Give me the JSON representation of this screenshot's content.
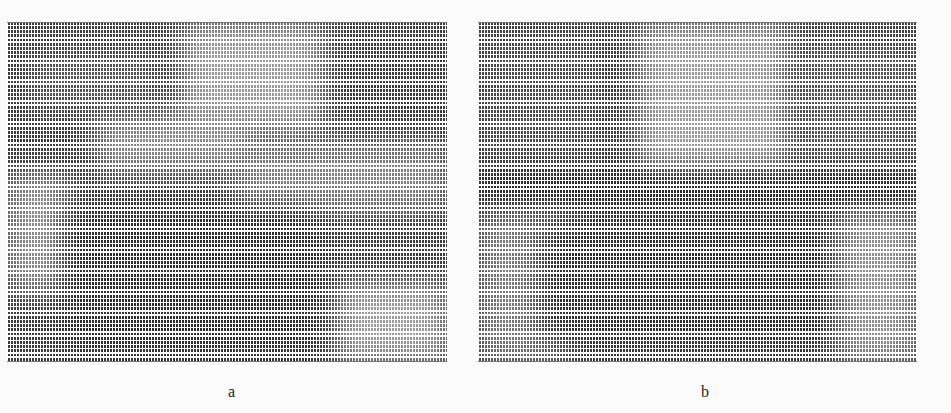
{
  "figure": {
    "panels": [
      {
        "id": "a",
        "label": "a",
        "description": "Texture/vector-field grid pattern with lighter regions top-center and lower-right",
        "base_color": "#3a3a3a",
        "regions": [
          {
            "left": 175,
            "top": 0,
            "width": 140,
            "height": 110,
            "color": "#9a9a9a"
          },
          {
            "left": 90,
            "top": 90,
            "width": 150,
            "height": 60,
            "color": "#8a8a8a"
          },
          {
            "left": 230,
            "top": 120,
            "width": 210,
            "height": 70,
            "color": "#7e7e7e"
          },
          {
            "left": 0,
            "top": 150,
            "width": 60,
            "height": 120,
            "color": "#8c8c8c"
          },
          {
            "left": 330,
            "top": 260,
            "width": 110,
            "height": 80,
            "color": "#9c9c9c"
          },
          {
            "left": 20,
            "top": 30,
            "width": 130,
            "height": 60,
            "color": "#555555"
          },
          {
            "left": 60,
            "top": 190,
            "width": 250,
            "height": 140,
            "color": "#2c2c2c"
          }
        ]
      },
      {
        "id": "b",
        "label": "b",
        "description": "Texture/vector-field grid pattern with dark horizontal band in middle",
        "base_color": "#3a3a3a",
        "regions": [
          {
            "left": 160,
            "top": 0,
            "width": 150,
            "height": 150,
            "color": "#9a9a9a"
          },
          {
            "left": 0,
            "top": 10,
            "width": 120,
            "height": 140,
            "color": "#4a4a4a"
          },
          {
            "left": 320,
            "top": 20,
            "width": 119,
            "height": 130,
            "color": "#555555"
          },
          {
            "left": 0,
            "top": 155,
            "width": 439,
            "height": 25,
            "color": "#1e1e1e"
          },
          {
            "left": 0,
            "top": 190,
            "width": 90,
            "height": 150,
            "color": "#7a7a7a"
          },
          {
            "left": 60,
            "top": 200,
            "width": 300,
            "height": 120,
            "color": "#2e2e2e"
          },
          {
            "left": 360,
            "top": 190,
            "width": 79,
            "height": 150,
            "color": "#8e8e8e"
          }
        ]
      }
    ]
  }
}
